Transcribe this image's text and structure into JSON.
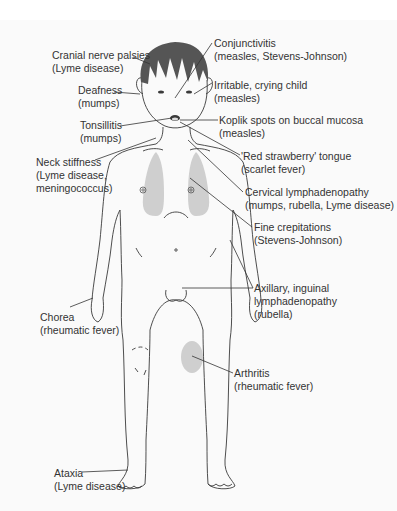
{
  "figure": {
    "colors": {
      "outline": "#3a3a3a",
      "hair": "#555555",
      "shade": "#cfcfcf",
      "text": "#333333",
      "background": "#fafafa"
    },
    "labels": [
      {
        "id": "cranial",
        "title": "Cranial nerve palsies",
        "cause": "(Lyme disease)"
      },
      {
        "id": "conjunctivitis",
        "title": "Conjunctivitis",
        "cause": "(measles, Stevens-Johnson)"
      },
      {
        "id": "deafness",
        "title": "Deafness",
        "cause": "(mumps)"
      },
      {
        "id": "irritable",
        "title": "Irritable, crying child",
        "cause": "(measles)"
      },
      {
        "id": "tonsillitis",
        "title": "Tonsillitis",
        "cause": "(mumps)"
      },
      {
        "id": "koplik",
        "title": "Koplik spots on buccal mucosa",
        "cause": "(measles)"
      },
      {
        "id": "strawberry",
        "title": "'Red strawberry' tongue",
        "cause": "(scarlet fever)"
      },
      {
        "id": "neck",
        "title": "Neck stiffness",
        "cause": "(Lyme disease,",
        "cause2": "meningococcus)"
      },
      {
        "id": "cervical",
        "title": "Cervical lymphadenopathy",
        "cause": "(mumps, rubella, Lyme disease)"
      },
      {
        "id": "crepitations",
        "title": "Fine crepitations",
        "cause": "(Stevens-Johnson)"
      },
      {
        "id": "axillary",
        "title": "Axillary, inguinal",
        "title2": "lymphadenopathy",
        "cause": "(rubella)"
      },
      {
        "id": "chorea",
        "title": "Chorea",
        "cause": "(rheumatic fever)"
      },
      {
        "id": "arthritis",
        "title": "Arthritis",
        "cause": "(rheumatic fever)"
      },
      {
        "id": "ataxia",
        "title": "Ataxia",
        "cause": "(Lyme disease)"
      }
    ]
  }
}
